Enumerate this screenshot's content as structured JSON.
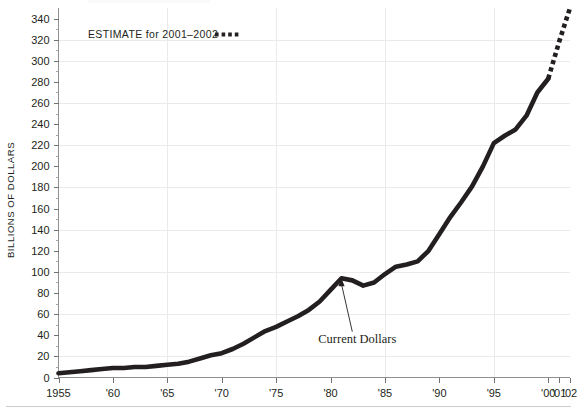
{
  "chart_data": {
    "type": "line",
    "title": "",
    "xlabel": "",
    "ylabel": "BILLIONS OF DOLLARS",
    "xlim": [
      1955,
      2002
    ],
    "ylim": [
      0,
      350
    ],
    "grid": true,
    "y_ticks": [
      0,
      20,
      40,
      60,
      80,
      100,
      120,
      140,
      160,
      180,
      200,
      220,
      240,
      260,
      280,
      300,
      320,
      340
    ],
    "y_tick_labels": [
      "0",
      "20",
      "40",
      "60",
      "80",
      "100",
      "120",
      "140",
      "160",
      "180",
      "200",
      "220",
      "240",
      "260",
      "280",
      "300",
      "320",
      "340"
    ],
    "y_minor_step": 10,
    "x_ticks": [
      1955,
      1960,
      1965,
      1970,
      1975,
      1980,
      1985,
      1990,
      1995,
      2000,
      2001,
      2002
    ],
    "x_tick_labels": [
      "1955",
      "'60",
      "'65",
      "'70",
      "'75",
      "'80",
      "'85",
      "'90",
      "'95",
      "'00",
      "'01",
      "'02"
    ],
    "x_gridlines": [
      1965,
      1975,
      1985,
      1995
    ],
    "y_gridlines": [
      20,
      60,
      100,
      140,
      180,
      220,
      260,
      300,
      320
    ],
    "series": [
      {
        "name": "Current Dollars",
        "style": "solid",
        "color": "#231f20",
        "x": [
          1955,
          1956,
          1957,
          1958,
          1959,
          1960,
          1961,
          1962,
          1963,
          1964,
          1965,
          1966,
          1967,
          1968,
          1969,
          1970,
          1971,
          1972,
          1973,
          1974,
          1975,
          1976,
          1977,
          1978,
          1979,
          1980,
          1981,
          1982,
          1983,
          1984,
          1985,
          1986,
          1987,
          1988,
          1989,
          1990,
          1991,
          1992,
          1993,
          1994,
          1995,
          1996,
          1997,
          1998,
          1999,
          2000
        ],
        "values": [
          4,
          5,
          6,
          7,
          8,
          9,
          9,
          10,
          10,
          11,
          12,
          13,
          15,
          18,
          21,
          23,
          27,
          32,
          38,
          44,
          48,
          53,
          58,
          64,
          72,
          83,
          94,
          92,
          87,
          90,
          98,
          105,
          107,
          110,
          120,
          136,
          152,
          166,
          181,
          200,
          222,
          229,
          235,
          248,
          270,
          283
        ]
      },
      {
        "name": "ESTIMATE for 2001-2002",
        "style": "dotted",
        "color": "#231f20",
        "x": [
          2000,
          2001,
          2002
        ],
        "values": [
          283,
          318,
          350
        ]
      }
    ],
    "annotations": [
      {
        "text": "Current Dollars",
        "x": 1982.0,
        "y": 33,
        "points_to_x": 1981.0,
        "points_to_y": 95
      }
    ],
    "legend": {
      "position": "top-left-inside",
      "label": "ESTIMATE for 2001–2002",
      "marker": "dotted-line"
    }
  },
  "labels": {
    "y_axis_title": "BILLIONS OF DOLLARS",
    "legend_label": "ESTIMATE for 2001–2002",
    "annotation_current_dollars": "Current Dollars"
  }
}
